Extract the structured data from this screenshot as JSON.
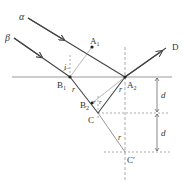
{
  "diagram": {
    "labels": {
      "alpha": "α",
      "beta": "β",
      "A1": "A",
      "A1_sub": "1",
      "A2": "A",
      "A2_sub": "2",
      "B1": "B",
      "B1_sub": "1",
      "B2": "B",
      "B2_sub": "2",
      "C": "C",
      "C_prime": "C′",
      "D": "D",
      "angle_i": "i",
      "angle_r": "r",
      "distance_d": "d"
    },
    "colors": {
      "ray": "#444444",
      "interface": "#9a9a9a",
      "dashed": "#888888",
      "text": "#333333"
    }
  }
}
